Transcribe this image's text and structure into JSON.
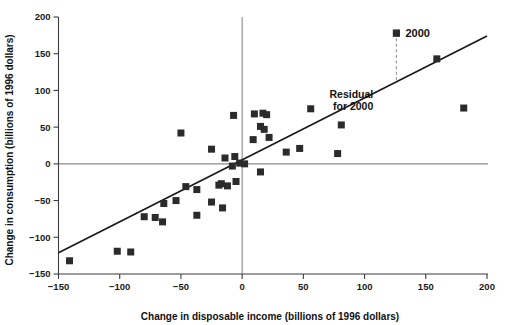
{
  "chart_data": {
    "type": "scatter",
    "title": "",
    "xlabel": "Change in disposable income (billions of 1996 dollars)",
    "ylabel": "Change in consumption (billions of 1996 dollars)",
    "xlim": [
      -150,
      200
    ],
    "ylim": [
      -150,
      200
    ],
    "xticks": [
      -150,
      -100,
      -50,
      0,
      50,
      100,
      150,
      200
    ],
    "xtick_labels": [
      "−150",
      "−100",
      "−50",
      "0",
      "50",
      "100",
      "150",
      "200"
    ],
    "yticks": [
      -150,
      -100,
      -50,
      0,
      50,
      100,
      150,
      200
    ],
    "ytick_labels": [
      "−150",
      "−100",
      "−50",
      "0",
      "50",
      "100",
      "150",
      "200"
    ],
    "grid": false,
    "zero_lines": {
      "x": 0,
      "y": 0
    },
    "legend": {
      "position": "top-right",
      "entries": [
        {
          "label": "2000",
          "marker": "square",
          "color": "#2b2b2b"
        }
      ]
    },
    "marker": {
      "shape": "square",
      "color": "#2b2b2b",
      "size": 7
    },
    "points": [
      {
        "x": -141,
        "y": -132
      },
      {
        "x": -102,
        "y": -119
      },
      {
        "x": -91,
        "y": -120
      },
      {
        "x": -80,
        "y": -72
      },
      {
        "x": -71,
        "y": -73
      },
      {
        "x": -65,
        "y": -79
      },
      {
        "x": -64,
        "y": -54
      },
      {
        "x": -54,
        "y": -50
      },
      {
        "x": -50,
        "y": 42
      },
      {
        "x": -46,
        "y": -31
      },
      {
        "x": -37,
        "y": -35
      },
      {
        "x": -37,
        "y": -70
      },
      {
        "x": -25,
        "y": -52
      },
      {
        "x": -25,
        "y": 20
      },
      {
        "x": -19,
        "y": -29
      },
      {
        "x": -17,
        "y": -27
      },
      {
        "x": -16,
        "y": -60
      },
      {
        "x": -14,
        "y": 8
      },
      {
        "x": -12,
        "y": -30
      },
      {
        "x": -8,
        "y": -3
      },
      {
        "x": -7,
        "y": 66
      },
      {
        "x": -6,
        "y": 10
      },
      {
        "x": -5,
        "y": -24
      },
      {
        "x": -2,
        "y": 1
      },
      {
        "x": 2,
        "y": 0
      },
      {
        "x": 9,
        "y": 33
      },
      {
        "x": 10,
        "y": 68
      },
      {
        "x": 15,
        "y": 51
      },
      {
        "x": 15,
        "y": -11
      },
      {
        "x": 17,
        "y": 69
      },
      {
        "x": 18,
        "y": 47
      },
      {
        "x": 20,
        "y": 67
      },
      {
        "x": 22,
        "y": 36
      },
      {
        "x": 36,
        "y": 16
      },
      {
        "x": 47,
        "y": 21
      },
      {
        "x": 56,
        "y": 75
      },
      {
        "x": 78,
        "y": 14
      },
      {
        "x": 81,
        "y": 53
      },
      {
        "x": 126,
        "y": 178
      },
      {
        "x": 159,
        "y": 143
      },
      {
        "x": 181,
        "y": 76
      }
    ],
    "regression_line": {
      "x0": -150,
      "y0": -121,
      "x1": 200,
      "y1": 174,
      "slope": 0.843,
      "intercept": 5.5
    },
    "annotations": [
      {
        "id": "residual-label",
        "text_line1": "Residual",
        "text_line2": "for 2000",
        "x": 112,
        "y": 120
      },
      {
        "id": "residual-marker",
        "type": "dashed-vertical",
        "x": 126,
        "y_top": 178,
        "y_bottom": 112
      },
      {
        "id": "legend-2000",
        "text": "2000",
        "x": 126,
        "y": 178
      }
    ]
  }
}
